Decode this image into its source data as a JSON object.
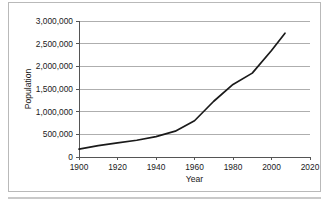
{
  "chart_data": {
    "type": "line",
    "title": "",
    "xlabel": "Year",
    "ylabel": "Population",
    "xlim": [
      1900,
      2020
    ],
    "ylim": [
      0,
      3000000
    ],
    "grid": "horizontal",
    "legend": "none",
    "x_ticks": [
      "1900",
      "1920",
      "1940",
      "1960",
      "1980",
      "2000",
      "2020"
    ],
    "x_tick_values": [
      1900,
      1920,
      1940,
      1960,
      1980,
      2000,
      2020
    ],
    "y_ticks": [
      "0",
      "500,000",
      "1,000,000",
      "1,500,000",
      "2,000,000",
      "2,500,000",
      "3,000,000"
    ],
    "y_tick_values": [
      0,
      500000,
      1000000,
      1500000,
      2000000,
      2500000,
      3000000
    ],
    "series": [
      {
        "name": "Population",
        "color": "#1a1a1a",
        "x": [
          1900,
          1910,
          1920,
          1930,
          1940,
          1950,
          1960,
          1970,
          1980,
          1990,
          2000,
          2007
        ],
        "values": [
          175000,
          250000,
          310000,
          370000,
          450000,
          570000,
          800000,
          1230000,
          1600000,
          1850000,
          2350000,
          2730000
        ]
      }
    ]
  },
  "colors": {
    "line": "#1a1a1a",
    "grid": "#9a9a9a",
    "axis": "#555555",
    "frame": "#b9b9b9",
    "background": "#ffffff"
  }
}
